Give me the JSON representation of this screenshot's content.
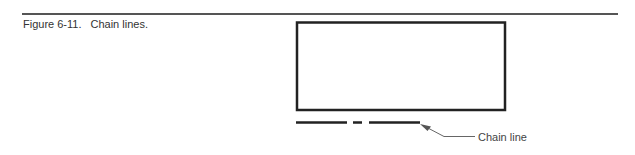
{
  "caption": {
    "number": "Figure 6-11.",
    "title": "Chain lines."
  },
  "figure": {
    "callout": {
      "label": "Chain line"
    }
  }
}
